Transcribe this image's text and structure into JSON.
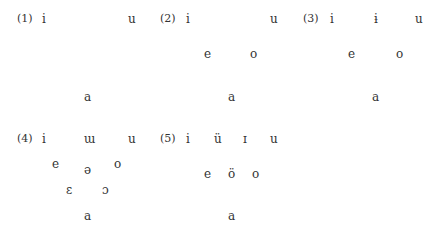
{
  "systems": [
    {
      "label": "(1)",
      "vowels": [
        {
          "ch": "i",
          "x": 42,
          "y": 12
        },
        {
          "ch": "u",
          "x": 128,
          "y": 12
        },
        {
          "ch": "a",
          "x": 84,
          "y": 90
        }
      ]
    },
    {
      "label": "(2)",
      "vowels": [
        {
          "ch": "i",
          "x": 186,
          "y": 12
        },
        {
          "ch": "u",
          "x": 270,
          "y": 12
        },
        {
          "ch": "e",
          "x": 204,
          "y": 47
        },
        {
          "ch": "o",
          "x": 250,
          "y": 47
        },
        {
          "ch": "a",
          "x": 228,
          "y": 90
        }
      ]
    },
    {
      "label": "(3)",
      "vowels": [
        {
          "ch": "i",
          "x": 330,
          "y": 12
        },
        {
          "ch": "ɨ",
          "x": 374,
          "y": 12
        },
        {
          "ch": "u",
          "x": 415,
          "y": 12
        },
        {
          "ch": "e",
          "x": 348,
          "y": 47
        },
        {
          "ch": "o",
          "x": 396,
          "y": 47
        },
        {
          "ch": "a",
          "x": 372,
          "y": 90
        }
      ]
    },
    {
      "label": "(4)",
      "vowels": [
        {
          "ch": "i",
          "x": 42,
          "y": 132
        },
        {
          "ch": "ɯ",
          "x": 84,
          "y": 132
        },
        {
          "ch": "u",
          "x": 128,
          "y": 132
        },
        {
          "ch": "e",
          "x": 52,
          "y": 157
        },
        {
          "ch": "ə",
          "x": 84,
          "y": 163
        },
        {
          "ch": "o",
          "x": 114,
          "y": 157
        },
        {
          "ch": "ɛ",
          "x": 66,
          "y": 183
        },
        {
          "ch": "ɔ",
          "x": 102,
          "y": 183
        },
        {
          "ch": "a",
          "x": 84,
          "y": 209
        }
      ]
    },
    {
      "label": "(5)",
      "vowels": [
        {
          "ch": "i",
          "x": 186,
          "y": 132
        },
        {
          "ch": "ü",
          "x": 214,
          "y": 132
        },
        {
          "ch": "ɪ",
          "x": 243,
          "y": 132
        },
        {
          "ch": "u",
          "x": 270,
          "y": 132
        },
        {
          "ch": "e",
          "x": 204,
          "y": 167
        },
        {
          "ch": "ö",
          "x": 228,
          "y": 167
        },
        {
          "ch": "o",
          "x": 252,
          "y": 167
        },
        {
          "ch": "a",
          "x": 228,
          "y": 209
        }
      ]
    }
  ],
  "label_pos": [
    [
      17,
      12
    ],
    [
      160,
      12
    ],
    [
      303,
      12
    ],
    [
      17,
      132
    ],
    [
      160,
      132
    ]
  ]
}
